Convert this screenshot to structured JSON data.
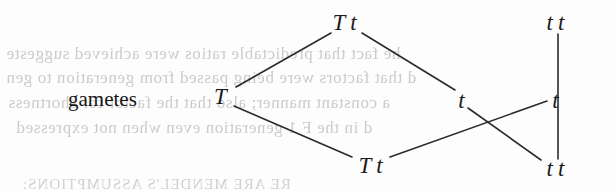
{
  "page": {
    "width": 615,
    "height": 191,
    "background_color": "#fdfdfd",
    "ink_color": "#1b1b1b",
    "ghost_color": "#c9c9c9"
  },
  "labels": {
    "gametes": "gametes"
  },
  "diagram": {
    "type": "genetic-cross-gamete-diagram",
    "nodes": [
      {
        "id": "parent-top",
        "text": "T t",
        "alleles": [
          "T",
          "t"
        ],
        "x": 345,
        "y": 22
      },
      {
        "id": "parent-top-right",
        "text": "t t",
        "alleles": [
          "t",
          "t"
        ],
        "x": 556,
        "y": 22
      },
      {
        "id": "gamete-T",
        "text": "T",
        "alleles": [
          "T"
        ],
        "x": 221,
        "y": 96
      },
      {
        "id": "gamete-t-mid",
        "text": "t",
        "alleles": [
          "t"
        ],
        "x": 462,
        "y": 100
      },
      {
        "id": "gamete-t-right",
        "text": "t",
        "alleles": [
          "t"
        ],
        "x": 556,
        "y": 100
      },
      {
        "id": "offspring-bottom",
        "text": "T t",
        "alleles": [
          "T",
          "t"
        ],
        "x": 371,
        "y": 165
      },
      {
        "id": "offspring-bottom-right",
        "text": "t t",
        "alleles": [
          "t",
          "t"
        ],
        "x": 556,
        "y": 168
      }
    ],
    "edges": [
      {
        "id": "edge-top-to-T",
        "from": "parent-top",
        "to": "gamete-T",
        "x1": 331,
        "y1": 33,
        "x2": 236,
        "y2": 87
      },
      {
        "id": "edge-top-to-t-mid",
        "from": "parent-top",
        "to": "gamete-t-mid",
        "x1": 362,
        "y1": 33,
        "x2": 455,
        "y2": 90
      },
      {
        "id": "edge-T-to-offspring",
        "from": "gamete-T",
        "to": "offspring-bottom",
        "x1": 234,
        "y1": 106,
        "x2": 352,
        "y2": 157
      },
      {
        "id": "edge-t-mid-to-offspring-right",
        "from": "gamete-t-mid",
        "to": "offspring-bottom-right",
        "x1": 468,
        "y1": 108,
        "x2": 541,
        "y2": 160
      },
      {
        "id": "edge-offspring-to-t-right",
        "from": "offspring-bottom",
        "to": "gamete-t-right",
        "x1": 390,
        "y1": 157,
        "x2": 547,
        "y2": 101
      },
      {
        "id": "edge-vertical-right",
        "from": "parent-top-right",
        "to": "offspring-bottom-right",
        "x1": 558,
        "y1": 34,
        "x2": 558,
        "y2": 159
      }
    ]
  },
  "background_text": {
    "description": "show-through text from reverse side of scanned page, mirrored",
    "lines": [
      {
        "id": "ghost-line-1",
        "text": "he fact that predictable ratios were achieved suggeste",
        "x": 6,
        "y": 44
      },
      {
        "id": "ghost-line-2",
        "text": "d that factors were being passed from generation to gen",
        "x": 6,
        "y": 68
      },
      {
        "id": "ghost-line-3",
        "text": "a constant manner; also that the factor for shortness",
        "x": 8,
        "y": 93
      },
      {
        "id": "ghost-line-4",
        "text": "d in the F 1 generation even when not expressed",
        "x": 16,
        "y": 118
      },
      {
        "id": "ghost-line-5",
        "text": "RE ARE MENDEL'S ASSUMPTIONS:",
        "x": 22,
        "y": 176,
        "style": "smallcaps"
      }
    ]
  }
}
